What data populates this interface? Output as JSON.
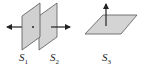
{
  "diagram": {
    "colors": {
      "surface_fill": "#d4d4d4",
      "surface_stroke": "#555555",
      "arrow": "#222222"
    },
    "surfaces": [
      {
        "id": "S1",
        "label": "S",
        "subscript": "1",
        "orientation": "vertical",
        "normal": "left"
      },
      {
        "id": "S2",
        "label": "S",
        "subscript": "2",
        "orientation": "vertical",
        "normal": "right"
      },
      {
        "id": "S3",
        "label": "S",
        "subscript": "3",
        "orientation": "horizontal",
        "normal": "up"
      }
    ]
  }
}
